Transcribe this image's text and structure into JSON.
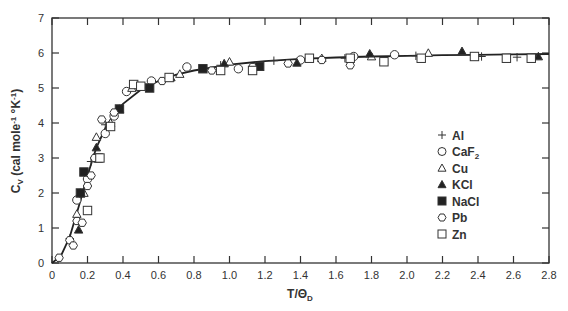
{
  "chart_data": {
    "type": "scatter",
    "title": "",
    "xlabel": "T/ΘD",
    "ylabel": "Cv (cal mole⁻¹ °K⁻¹)",
    "xlim": [
      0,
      2.8
    ],
    "ylim": [
      0,
      7
    ],
    "xticks": [
      "0",
      "0.2",
      "0.4",
      "0.6",
      "0.8",
      "1.0",
      "1.2",
      "1.4",
      "1.6",
      "1.8",
      "2.0",
      "2.2",
      "2.4",
      "2.6",
      "2.8"
    ],
    "yticks": [
      "0",
      "1",
      "2",
      "3",
      "4",
      "5",
      "6",
      "7"
    ],
    "grid": false,
    "legend_position": "right-center",
    "legend": [
      {
        "name": "Al",
        "marker": "plus"
      },
      {
        "name": "CaF2",
        "marker": "circle-open"
      },
      {
        "name": "Cu",
        "marker": "triangle-open"
      },
      {
        "name": "KCl",
        "marker": "triangle-filled"
      },
      {
        "name": "NaCl",
        "marker": "square-filled"
      },
      {
        "name": "Pb",
        "marker": "hexagon-open"
      },
      {
        "name": "Zn",
        "marker": "square-open"
      }
    ],
    "curve": {
      "name": "Debye theory",
      "x": [
        0,
        0.05,
        0.1,
        0.15,
        0.2,
        0.25,
        0.3,
        0.35,
        0.4,
        0.5,
        0.6,
        0.7,
        0.8,
        1.0,
        1.2,
        1.4,
        1.6,
        1.8,
        2.0,
        2.2,
        2.4,
        2.6,
        2.8
      ],
      "y": [
        0,
        0.2,
        0.75,
        1.6,
        2.5,
        3.3,
        3.85,
        4.25,
        4.55,
        4.95,
        5.2,
        5.38,
        5.5,
        5.67,
        5.77,
        5.83,
        5.87,
        5.9,
        5.92,
        5.94,
        5.95,
        5.96,
        5.97
      ]
    },
    "series": [
      {
        "name": "Al",
        "x": [
          0.1,
          0.22,
          0.3,
          0.95,
          1.25,
          1.65,
          2.05,
          2.42,
          2.62
        ],
        "y": [
          0.7,
          2.9,
          3.95,
          5.65,
          5.78,
          5.85,
          5.92,
          5.9,
          5.88
        ]
      },
      {
        "name": "CaF2",
        "x": [
          0.14,
          0.2,
          0.3,
          0.35,
          0.42,
          0.56,
          0.76,
          1.05,
          1.4,
          1.7,
          1.93
        ],
        "y": [
          1.8,
          2.4,
          3.7,
          4.2,
          4.9,
          5.2,
          5.6,
          5.55,
          5.8,
          5.9,
          5.95
        ]
      },
      {
        "name": "Cu",
        "x": [
          0.14,
          0.18,
          0.25,
          0.33,
          0.45,
          0.72,
          1.0,
          1.52,
          1.8,
          2.12
        ],
        "y": [
          1.4,
          2.0,
          3.6,
          4.0,
          5.0,
          5.4,
          5.75,
          5.85,
          5.9,
          6.0
        ]
      },
      {
        "name": "KCl",
        "x": [
          0.15,
          0.16,
          0.25,
          0.38,
          0.67,
          0.97,
          1.38,
          1.79,
          2.31,
          2.74
        ],
        "y": [
          0.95,
          2.0,
          3.3,
          4.4,
          5.3,
          5.7,
          5.72,
          5.98,
          6.05,
          5.9
        ]
      },
      {
        "name": "NaCl",
        "x": [
          0.16,
          0.18,
          0.26,
          0.38,
          0.55,
          0.85,
          1.17
        ],
        "y": [
          2.0,
          2.6,
          3.0,
          4.4,
          5.0,
          5.55,
          5.62
        ]
      },
      {
        "name": "Pb",
        "x": [
          0.04,
          0.1,
          0.12,
          0.14,
          0.17,
          0.2,
          0.22,
          0.24,
          0.28,
          0.35,
          0.62,
          0.9,
          1.13,
          1.33,
          1.52,
          1.68
        ],
        "y": [
          0.15,
          0.65,
          0.5,
          1.2,
          1.15,
          2.2,
          2.5,
          3.0,
          4.1,
          4.3,
          5.2,
          5.5,
          5.6,
          5.7,
          5.8,
          5.65
        ]
      },
      {
        "name": "Zn",
        "x": [
          0.2,
          0.27,
          0.33,
          0.46,
          0.5,
          0.66,
          0.95,
          1.13,
          1.45,
          1.68,
          1.87,
          2.08,
          2.38,
          2.56,
          2.7
        ],
        "y": [
          1.5,
          3.0,
          3.9,
          5.1,
          5.05,
          5.3,
          5.5,
          5.5,
          5.85,
          5.85,
          5.75,
          5.85,
          5.9,
          5.85,
          5.85
        ]
      }
    ]
  }
}
